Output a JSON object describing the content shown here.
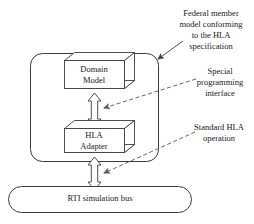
{
  "diagram": {
    "stroke_color": "#3c3c3c",
    "fill_color": "#ffffff",
    "text_color": "#1a1a1a",
    "container": {
      "name": "federate-container",
      "shape": "rounded-rectangle"
    },
    "nodes": [
      {
        "id": "domain-model",
        "label": "Domain\nModel",
        "shape": "3d-box"
      },
      {
        "id": "hla-adapter",
        "label": "HLA\nAdapter",
        "shape": "3d-box"
      },
      {
        "id": "rti-bus",
        "label": "RTI simulation bus",
        "shape": "stadium"
      }
    ],
    "connectors": [
      {
        "id": "domain-to-adapter",
        "style": "hollow-double-headed-arrow",
        "from": "domain-model",
        "to": "hla-adapter"
      },
      {
        "id": "adapter-to-bus",
        "style": "hollow-double-headed-arrow",
        "from": "hla-adapter",
        "to": "rti-bus"
      }
    ],
    "annotations": [
      {
        "id": "federal-member",
        "label": "Federal member\nmodel conforming\nto the HLA\nspecification",
        "leader": "solid-line-with-arrowhead",
        "points_to": "federate-container"
      },
      {
        "id": "special-interface",
        "label": "Special\nprogramming\ninterface",
        "leader": "dashed-line-with-arrowhead",
        "points_to": "domain-to-adapter"
      },
      {
        "id": "standard-operation",
        "label": "Standard HLA\noperation",
        "leader": "dashed-line-with-arrowhead",
        "points_to": "adapter-to-bus"
      }
    ]
  }
}
